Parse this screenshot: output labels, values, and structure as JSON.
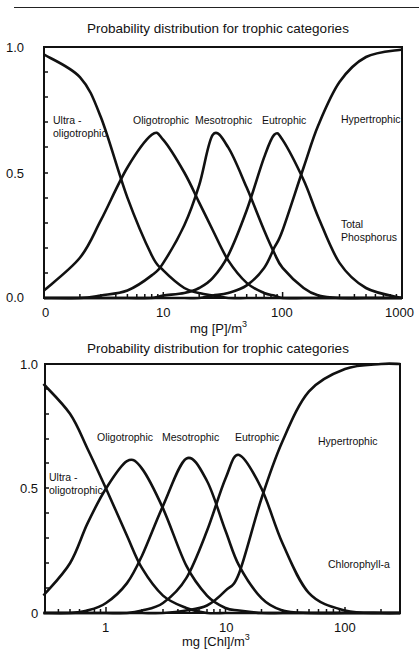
{
  "chart_data": [
    {
      "type": "line",
      "title": "Probability distribution for trophic categories",
      "xlabel": "mg [P]/m3",
      "xlabel_main": "mg [P]/m",
      "xlabel_sup": "3",
      "ylabel": "",
      "xscale": "log",
      "xlim": [
        1,
        1000
      ],
      "ylim": [
        0,
        1.0
      ],
      "x_tick_labels": [
        "0",
        "10",
        "100",
        "1000"
      ],
      "y_tick_labels": [
        "0.0",
        "0.5",
        "1.0"
      ],
      "grid": false,
      "annotation": [
        "Total",
        "Phosphorus"
      ],
      "x": [
        1,
        2,
        3,
        5,
        8,
        10,
        15,
        20,
        26,
        35,
        50,
        70,
        85,
        100,
        150,
        200,
        300,
        500,
        1000
      ],
      "series": [
        {
          "name": "Ultra - oligotrophic",
          "label_lines": [
            "Ultra -",
            "oligotrophic"
          ],
          "values": [
            0.97,
            0.88,
            0.72,
            0.4,
            0.17,
            0.11,
            0.04,
            0.02,
            0.01,
            0.0,
            0.0,
            0.0,
            0.0,
            0.0,
            0.0,
            0.0,
            0.0,
            0.0,
            0.0
          ]
        },
        {
          "name": "Oligotrophic",
          "label_lines": [
            "Oligotrophic"
          ],
          "values": [
            0.03,
            0.16,
            0.31,
            0.52,
            0.65,
            0.63,
            0.5,
            0.38,
            0.27,
            0.15,
            0.06,
            0.02,
            0.01,
            0.0,
            0.0,
            0.0,
            0.0,
            0.0,
            0.0
          ]
        },
        {
          "name": "Mesotrophic",
          "label_lines": [
            "Mesotrophic"
          ],
          "values": [
            0.0,
            0.0,
            0.01,
            0.03,
            0.09,
            0.14,
            0.29,
            0.45,
            0.65,
            0.6,
            0.44,
            0.27,
            0.18,
            0.12,
            0.04,
            0.01,
            0.0,
            0.0,
            0.0
          ]
        },
        {
          "name": "Eutrophic",
          "label_lines": [
            "Eutrophic"
          ],
          "values": [
            0.0,
            0.0,
            0.0,
            0.0,
            0.0,
            0.01,
            0.02,
            0.04,
            0.08,
            0.17,
            0.35,
            0.56,
            0.65,
            0.63,
            0.47,
            0.32,
            0.14,
            0.04,
            0.0
          ]
        },
        {
          "name": "Hypertrophic",
          "label_lines": [
            "Hypertrophic"
          ],
          "values": [
            0.0,
            0.0,
            0.0,
            0.0,
            0.0,
            0.0,
            0.0,
            0.0,
            0.01,
            0.02,
            0.05,
            0.12,
            0.2,
            0.27,
            0.52,
            0.69,
            0.86,
            0.96,
            0.99
          ]
        }
      ]
    },
    {
      "type": "line",
      "title": "Probability distribution for trophic categories",
      "xlabel": "mg [Chl]/m3",
      "xlabel_main": "mg [Chl]/m",
      "xlabel_sup": "3",
      "ylabel": "",
      "xscale": "log",
      "xlim": [
        0.3,
        290
      ],
      "ylim": [
        0,
        1.0
      ],
      "x_tick_labels": [
        "1",
        "10",
        "100"
      ],
      "y_tick_labels": [
        "0",
        "0.5",
        "1.0"
      ],
      "grid": false,
      "annotation": [
        "Chlorophyll-a"
      ],
      "x": [
        0.3,
        0.5,
        0.7,
        1,
        1.5,
        2,
        3,
        4.7,
        7,
        10,
        13,
        20,
        30,
        50,
        100,
        200,
        290
      ],
      "series": [
        {
          "name": "Ultra - oligotrophic",
          "label_lines": [
            "Ultra -",
            "oligotrophic"
          ],
          "values": [
            0.92,
            0.8,
            0.66,
            0.5,
            0.31,
            0.18,
            0.07,
            0.02,
            0.0,
            0.0,
            0.0,
            0.0,
            0.0,
            0.0,
            0.0,
            0.0,
            0.0
          ]
        },
        {
          "name": "Oligotrophic",
          "label_lines": [
            "Oligotrophic"
          ],
          "values": [
            0.07,
            0.2,
            0.36,
            0.5,
            0.61,
            0.58,
            0.42,
            0.19,
            0.07,
            0.02,
            0.01,
            0.0,
            0.0,
            0.0,
            0.0,
            0.0,
            0.0
          ]
        },
        {
          "name": "Mesotrophic",
          "label_lines": [
            "Mesotrophic"
          ],
          "values": [
            0.0,
            0.0,
            0.01,
            0.04,
            0.12,
            0.23,
            0.43,
            0.62,
            0.53,
            0.33,
            0.19,
            0.06,
            0.01,
            0.0,
            0.0,
            0.0,
            0.0
          ]
        },
        {
          "name": "Eutrophic",
          "label_lines": [
            "Eutrophic"
          ],
          "values": [
            0.0,
            0.0,
            0.0,
            0.0,
            0.0,
            0.01,
            0.04,
            0.14,
            0.33,
            0.54,
            0.635,
            0.5,
            0.28,
            0.08,
            0.01,
            0.0,
            0.0
          ]
        },
        {
          "name": "Hypertrophic",
          "label_lines": [
            "Hypertrophic"
          ],
          "values": [
            0.0,
            0.0,
            0.0,
            0.0,
            0.0,
            0.0,
            0.0,
            0.01,
            0.03,
            0.09,
            0.16,
            0.46,
            0.69,
            0.89,
            0.98,
            1.0,
            1.0
          ]
        }
      ]
    }
  ],
  "page": {
    "charts": [
      {
        "title": "Probability distribution for trophic categories",
        "x_ticks": [
          "0",
          "10",
          "100",
          "1000"
        ],
        "y_ticks": [
          "1.0",
          "0.5",
          "0.0"
        ],
        "xlabel_main": "mg [P]/m",
        "xlabel_sup": "3",
        "labels": {
          "ultra_1": "Ultra -",
          "ultra_2": "oligotrophic",
          "oligo": "Oligotrophic",
          "meso": "Mesotrophic",
          "eutro": "Eutrophic",
          "hyper": "Hypertrophic",
          "note_1": "Total",
          "note_2": "Phosphorus"
        }
      },
      {
        "title": "Probability distribution for trophic categories",
        "x_ticks": [
          "1",
          "10",
          "100"
        ],
        "y_ticks": [
          "1.0",
          "0.5",
          "0"
        ],
        "xlabel_main": "mg [Chl]/m",
        "xlabel_sup": "3",
        "labels": {
          "ultra_1": "Ultra -",
          "ultra_2": "oligotrophic",
          "oligo": "Oligotrophic",
          "meso": "Mesotrophic",
          "eutro": "Eutrophic",
          "hyper": "Hypertrophic",
          "note_1": "Chlorophyll-a"
        }
      }
    ]
  }
}
